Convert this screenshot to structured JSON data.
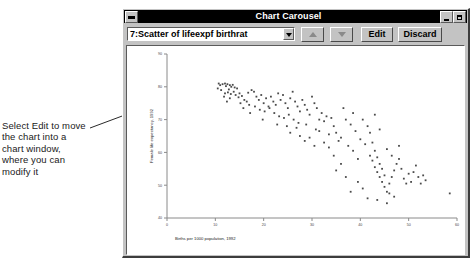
{
  "annotation": {
    "text": "Select Edit to move the chart into a chart window, where you can modify it"
  },
  "window": {
    "title": "Chart Carousel",
    "system_menu_icon": "system-menu-icon",
    "minimize_icon": "minimize-icon",
    "maximize_icon": "maximize-icon"
  },
  "toolbar": {
    "combo_value": "7:Scatter of lifeexpf birthrat",
    "combo_arrow_icon": "chevron-down-icon",
    "prev_label": "",
    "next_label": "",
    "prev_icon": "arrow-up-icon",
    "next_icon": "arrow-down-icon",
    "edit_label": "Edit",
    "discard_label": "Discard"
  },
  "chart_data": {
    "type": "scatter",
    "title": "",
    "xlabel": "Births per 1000 population, 1992",
    "ylabel": "Female life expectancy, 1992",
    "xlim": [
      0,
      60
    ],
    "ylim": [
      40,
      90
    ],
    "xticks": [
      0,
      10,
      20,
      30,
      40,
      50,
      60
    ],
    "yticks": [
      40,
      50,
      60,
      70,
      80,
      90
    ],
    "grid": false,
    "legend": false,
    "marker_color": "#4a4a4a",
    "points": [
      [
        10.7,
        81.0
      ],
      [
        11.0,
        80.5
      ],
      [
        11.5,
        80.8
      ],
      [
        12.0,
        81.0
      ],
      [
        12.2,
        80.2
      ],
      [
        12.5,
        80.8
      ],
      [
        13.0,
        80.5
      ],
      [
        13.3,
        80.0
      ],
      [
        13.6,
        80.6
      ],
      [
        14.0,
        79.8
      ],
      [
        10.5,
        79.5
      ],
      [
        11.2,
        79.0
      ],
      [
        12.8,
        79.2
      ],
      [
        13.8,
        78.5
      ],
      [
        14.5,
        79.5
      ],
      [
        12.0,
        78.0
      ],
      [
        12.6,
        78.3
      ],
      [
        13.2,
        77.8
      ],
      [
        14.2,
        77.5
      ],
      [
        15.0,
        78.0
      ],
      [
        11.8,
        77.0
      ],
      [
        13.0,
        76.5
      ],
      [
        14.8,
        76.8
      ],
      [
        15.5,
        77.2
      ],
      [
        16.0,
        76.0
      ],
      [
        12.4,
        75.5
      ],
      [
        15.2,
        75.0
      ],
      [
        16.5,
        75.5
      ],
      [
        17.0,
        74.5
      ],
      [
        18.0,
        78.5
      ],
      [
        18.5,
        77.0
      ],
      [
        19.0,
        76.0
      ],
      [
        19.5,
        77.5
      ],
      [
        20.0,
        75.0
      ],
      [
        20.5,
        76.5
      ],
      [
        21.0,
        74.0
      ],
      [
        21.5,
        77.0
      ],
      [
        22.0,
        75.5
      ],
      [
        22.5,
        74.5
      ],
      [
        23.0,
        78.0
      ],
      [
        23.5,
        76.0
      ],
      [
        24.0,
        77.5
      ],
      [
        24.5,
        75.0
      ],
      [
        25.0,
        73.5
      ],
      [
        25.5,
        76.5
      ],
      [
        26.0,
        78.5
      ],
      [
        26.5,
        75.5
      ],
      [
        27.0,
        74.0
      ],
      [
        27.5,
        72.5
      ],
      [
        28.0,
        76.0
      ],
      [
        18.2,
        74.0
      ],
      [
        19.2,
        73.0
      ],
      [
        20.2,
        72.5
      ],
      [
        21.2,
        73.5
      ],
      [
        22.2,
        72.0
      ],
      [
        23.2,
        71.0
      ],
      [
        24.2,
        70.5
      ],
      [
        25.2,
        71.5
      ],
      [
        26.2,
        70.0
      ],
      [
        27.2,
        69.0
      ],
      [
        28.5,
        74.5
      ],
      [
        29.0,
        73.0
      ],
      [
        29.5,
        71.5
      ],
      [
        30.0,
        77.0
      ],
      [
        30.5,
        75.0
      ],
      [
        31.0,
        73.5
      ],
      [
        31.5,
        70.0
      ],
      [
        32.0,
        72.0
      ],
      [
        32.5,
        69.5
      ],
      [
        33.0,
        71.0
      ],
      [
        22.8,
        68.5
      ],
      [
        24.8,
        68.0
      ],
      [
        26.8,
        67.5
      ],
      [
        28.8,
        68.5
      ],
      [
        30.8,
        67.0
      ],
      [
        25.5,
        66.0
      ],
      [
        27.5,
        65.0
      ],
      [
        29.5,
        64.5
      ],
      [
        31.5,
        66.5
      ],
      [
        33.5,
        65.5
      ],
      [
        34.0,
        70.5
      ],
      [
        34.5,
        68.0
      ],
      [
        35.0,
        66.0
      ],
      [
        35.5,
        63.5
      ],
      [
        36.0,
        64.5
      ],
      [
        37.0,
        70.0
      ],
      [
        38.0,
        68.5
      ],
      [
        39.0,
        66.5
      ],
      [
        40.0,
        64.0
      ],
      [
        41.0,
        62.5
      ],
      [
        38.5,
        72.0
      ],
      [
        40.5,
        70.0
      ],
      [
        41.5,
        68.0
      ],
      [
        42.0,
        66.0
      ],
      [
        42.5,
        63.0
      ],
      [
        43.0,
        60.5
      ],
      [
        43.5,
        58.5
      ],
      [
        44.0,
        56.5
      ],
      [
        44.5,
        55.0
      ],
      [
        45.0,
        53.0
      ],
      [
        42.0,
        59.0
      ],
      [
        42.5,
        57.5
      ],
      [
        43.0,
        55.5
      ],
      [
        43.5,
        54.0
      ],
      [
        44.0,
        52.5
      ],
      [
        44.5,
        51.0
      ],
      [
        45.0,
        49.5
      ],
      [
        45.5,
        48.0
      ],
      [
        46.0,
        50.5
      ],
      [
        46.5,
        52.5
      ],
      [
        47.0,
        54.5
      ],
      [
        47.5,
        56.5
      ],
      [
        48.0,
        58.0
      ],
      [
        48.5,
        55.0
      ],
      [
        49.0,
        52.0
      ],
      [
        49.5,
        50.5
      ],
      [
        50.0,
        53.5
      ],
      [
        50.5,
        51.0
      ],
      [
        51.0,
        54.0
      ],
      [
        51.5,
        56.0
      ],
      [
        46.0,
        47.5
      ],
      [
        47.0,
        46.5
      ],
      [
        43.5,
        45.5
      ],
      [
        45.5,
        44.5
      ],
      [
        41.5,
        46.0
      ],
      [
        52.0,
        52.5
      ],
      [
        52.5,
        50.5
      ],
      [
        53.0,
        53.0
      ],
      [
        53.5,
        51.5
      ],
      [
        58.5,
        47.5
      ],
      [
        36.5,
        73.5
      ],
      [
        37.5,
        62.0
      ],
      [
        38.5,
        60.5
      ],
      [
        39.5,
        58.0
      ],
      [
        33.5,
        61.5
      ],
      [
        34.5,
        59.0
      ],
      [
        32.5,
        63.0
      ],
      [
        30.5,
        62.0
      ],
      [
        28.5,
        63.5
      ],
      [
        36.0,
        56.5
      ],
      [
        35.0,
        54.5
      ],
      [
        37.0,
        52.5
      ],
      [
        39.5,
        51.0
      ],
      [
        40.5,
        49.0
      ],
      [
        38.0,
        48.0
      ],
      [
        17.5,
        79.0
      ],
      [
        16.8,
        78.2
      ],
      [
        15.8,
        73.5
      ],
      [
        17.2,
        72.0
      ],
      [
        19.8,
        70.0
      ],
      [
        43.0,
        71.5
      ],
      [
        44.0,
        67.0
      ],
      [
        45.5,
        61.0
      ],
      [
        46.5,
        59.0
      ],
      [
        48.0,
        62.0
      ]
    ]
  }
}
